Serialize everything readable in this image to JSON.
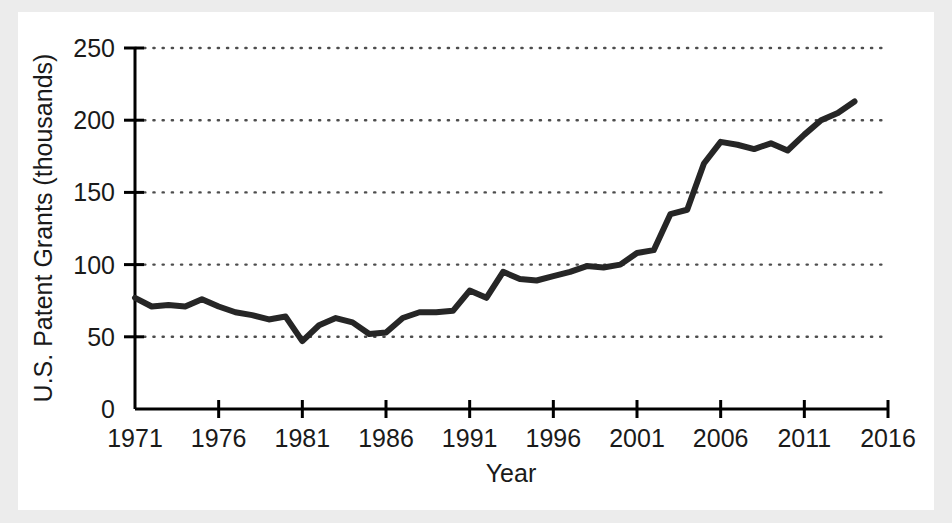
{
  "figure": {
    "background_color": "#ececec",
    "card_color": "#ffffff",
    "line_color": "#262626",
    "axis_color": "#000000",
    "grid_color": "#4d4d4d"
  },
  "chart_data": {
    "type": "line",
    "title": "",
    "xlabel": "Year",
    "ylabel": "U.S. Patent Grants (thousands)",
    "xlim": [
      1971,
      2016
    ],
    "ylim": [
      0,
      250
    ],
    "xticks": [
      1971,
      1976,
      1981,
      1986,
      1991,
      1996,
      2001,
      2006,
      2011,
      2016
    ],
    "xtick_labels": [
      "1971",
      "1976",
      "1981",
      "1986",
      "1991",
      "1996",
      "2001",
      "2006",
      "2011",
      "2016"
    ],
    "yticks": [
      0,
      50,
      100,
      150,
      200,
      250
    ],
    "ytick_labels": [
      "0",
      "50",
      "100",
      "150",
      "200",
      "250"
    ],
    "grid": "horizontal-dotted",
    "legend": "none",
    "series": [
      {
        "name": "U.S. Patent Grants",
        "color": "#262626",
        "x": [
          1971,
          1972,
          1973,
          1974,
          1975,
          1976,
          1977,
          1978,
          1979,
          1980,
          1981,
          1982,
          1983,
          1984,
          1985,
          1986,
          1987,
          1988,
          1989,
          1990,
          1991,
          1992,
          1993,
          1994,
          1995,
          1996,
          1997,
          1998,
          1999,
          2000,
          2001,
          2002,
          2003,
          2004,
          2005,
          2006,
          2007,
          2008,
          2009
        ],
        "values": [
          77,
          71,
          72,
          71,
          76,
          71,
          67,
          65,
          62,
          64,
          47,
          58,
          63,
          60,
          52,
          53,
          63,
          67,
          67,
          68,
          82,
          77,
          95,
          90,
          89,
          92,
          95,
          99,
          98,
          100,
          108,
          110,
          135,
          138,
          170,
          185,
          183,
          180,
          184
        ],
        "note_peak_values": [
          180,
          179,
          190,
          200,
          205,
          213
        ]
      }
    ],
    "data_points": [
      {
        "year": 1971,
        "value": 77
      },
      {
        "year": 1972,
        "value": 71
      },
      {
        "year": 1973,
        "value": 72
      },
      {
        "year": 1974,
        "value": 71
      },
      {
        "year": 1975,
        "value": 76
      },
      {
        "year": 1976,
        "value": 71
      },
      {
        "year": 1977,
        "value": 67
      },
      {
        "year": 1978,
        "value": 65
      },
      {
        "year": 1979,
        "value": 62
      },
      {
        "year": 1980,
        "value": 64
      },
      {
        "year": 1981,
        "value": 47
      },
      {
        "year": 1982,
        "value": 58
      },
      {
        "year": 1983,
        "value": 63
      },
      {
        "year": 1984,
        "value": 60
      },
      {
        "year": 1985,
        "value": 52
      },
      {
        "year": 1986,
        "value": 53
      },
      {
        "year": 1987,
        "value": 63
      },
      {
        "year": 1988,
        "value": 67
      },
      {
        "year": 1989,
        "value": 67
      },
      {
        "year": 1990,
        "value": 68
      },
      {
        "year": 1991,
        "value": 82
      },
      {
        "year": 1992,
        "value": 77
      },
      {
        "year": 1993,
        "value": 95
      },
      {
        "year": 1994,
        "value": 90
      },
      {
        "year": 1995,
        "value": 89
      },
      {
        "year": 1996,
        "value": 92
      },
      {
        "year": 1997,
        "value": 95
      },
      {
        "year": 1998,
        "value": 99
      },
      {
        "year": 1999,
        "value": 98
      },
      {
        "year": 2000,
        "value": 100
      },
      {
        "year": 2001,
        "value": 108
      },
      {
        "year": 2002,
        "value": 110
      },
      {
        "year": 2003,
        "value": 135
      },
      {
        "year": 2004,
        "value": 138
      },
      {
        "year": 2005,
        "value": 170
      },
      {
        "year": 2006,
        "value": 185
      },
      {
        "year": 2007,
        "value": 183
      },
      {
        "year": 2008,
        "value": 180
      },
      {
        "year": 2009,
        "value": 184
      },
      {
        "year": 2010,
        "value": 179
      },
      {
        "year": 2011,
        "value": 190
      },
      {
        "year": 2012,
        "value": 200
      },
      {
        "year": 2013,
        "value": 205
      },
      {
        "year": 2014,
        "value": 213
      }
    ]
  }
}
